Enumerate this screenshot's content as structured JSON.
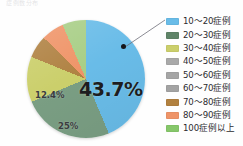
{
  "title_sliver": "症例数分布",
  "chart_data": {
    "type": "pie",
    "title": "",
    "xlabel": "",
    "ylabel": "",
    "legend_position": "right",
    "grid": false,
    "categories": [
      "10〜20症例",
      "20〜30症例",
      "30〜40症例",
      "40〜50症例",
      "50〜60症例",
      "60〜70症例",
      "70〜80症例",
      "80〜90症例",
      "100症例以上"
    ],
    "values": [
      43.7,
      25,
      12.4,
      0,
      0,
      0,
      6.2,
      6.2,
      6.5
    ],
    "colors": [
      "#69bce8",
      "#7a9e83",
      "#cbcf6b",
      "#a8a8a8",
      "#a8a8a8",
      "#a8a8a8",
      "#b08243",
      "#ef9468",
      "#a8ce86"
    ],
    "data_labels": [
      {
        "category": "10〜20症例",
        "text": "43.7%"
      },
      {
        "category": "20〜30症例",
        "text": "25%"
      },
      {
        "category": "100症例以上",
        "text": "12.4%"
      }
    ],
    "annotations": [
      {
        "type": "callout-dot",
        "target": "10〜20症例"
      }
    ]
  },
  "labels": {
    "main": "43.7%",
    "second": "25%",
    "third": "12.4%"
  },
  "legend": {
    "items": [
      {
        "label": "10〜20症例",
        "color": "#69bce8"
      },
      {
        "label": "20〜30症例",
        "color": "#5f8468"
      },
      {
        "label": "30〜40症例",
        "color": "#cbcf6b"
      },
      {
        "label": "40〜50症例",
        "color": "#a9a9a9"
      },
      {
        "label": "50〜60症例",
        "color": "#a5a5a5"
      },
      {
        "label": "60〜70症例",
        "color": "#a3a3a3"
      },
      {
        "label": "70〜80症例",
        "color": "#b2813f"
      },
      {
        "label": "80〜90症例",
        "color": "#ef9468"
      },
      {
        "label": "100症例以上",
        "color": "#86c76a"
      }
    ]
  }
}
